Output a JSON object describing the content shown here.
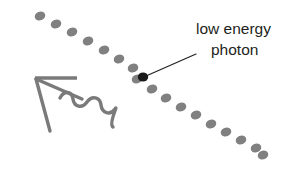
{
  "figure": {
    "name": "low-energy-photon-scattering-diagram",
    "background_color": "#ffffff",
    "width": 301,
    "height": 171
  },
  "annotation": {
    "line1": "low energy",
    "line2": "photon",
    "text_color": "#231f20",
    "font_size": 15.5,
    "leader_line": {
      "from_x": 196,
      "from_y": 54,
      "to_x": 146,
      "to_y": 76,
      "color": "#231f20",
      "width": 1.2
    }
  },
  "photon_marker": {
    "label": "photon-highlight-dot",
    "cx": 143,
    "cy": 77,
    "rx": 5.2,
    "ry": 4.6,
    "color": "#1a1a1a"
  },
  "dot_chain": {
    "label": "dotted-trajectory",
    "color": "#808080",
    "rx": 5.4,
    "ry": 4.4,
    "rotation": -22,
    "dots": [
      {
        "cx": 40,
        "cy": 16
      },
      {
        "cx": 56,
        "cy": 24
      },
      {
        "cx": 72,
        "cy": 32
      },
      {
        "cx": 88,
        "cy": 41
      },
      {
        "cx": 104,
        "cy": 50
      },
      {
        "cx": 119,
        "cy": 59
      },
      {
        "cx": 133,
        "cy": 68
      },
      {
        "cx": 137,
        "cy": 79
      },
      {
        "cx": 152,
        "cy": 89
      },
      {
        "cx": 166,
        "cy": 98
      },
      {
        "cx": 181,
        "cy": 107
      },
      {
        "cx": 196,
        "cy": 115
      },
      {
        "cx": 211,
        "cy": 124
      },
      {
        "cx": 226,
        "cy": 132
      },
      {
        "cx": 241,
        "cy": 140
      },
      {
        "cx": 256,
        "cy": 148
      },
      {
        "cx": 263,
        "cy": 155
      }
    ]
  },
  "scattered_wave_arrow": {
    "label": "scattered-photon-arrow",
    "color": "#7a7a7a",
    "stroke_width": 3.4,
    "arrow_bar": {
      "x1": 35,
      "y1": 78,
      "x2": 77,
      "y2": 78
    },
    "arrow_shaft": {
      "x1": 36,
      "y1": 79,
      "x2": 50,
      "y2": 131
    },
    "arrow_barb": {
      "x1": 36,
      "y1": 79,
      "x2": 82,
      "y2": 99
    },
    "wave_path": "M 60 98 C 64 90, 72 91, 73 99 C 74 107, 82 109, 87 102 C 92 95, 100 97, 101 105 C 102 113, 110 116, 115 109 C 119 103, 108 124, 113 127"
  }
}
